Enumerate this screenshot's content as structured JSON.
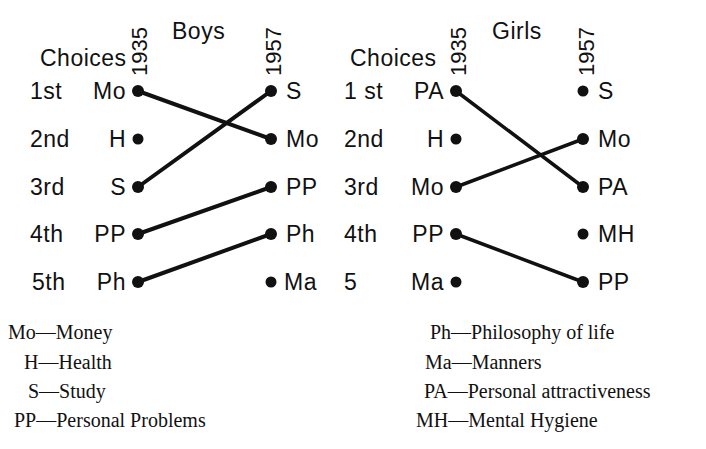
{
  "boys": {
    "title": "Boys",
    "choices_header": "Choices",
    "year_left": "1935",
    "year_right": "1957",
    "ranks": [
      "1st",
      "2nd",
      "3rd",
      "4th",
      "5th"
    ],
    "left_items": [
      "Mo",
      "H",
      "S",
      "PP",
      "Ph"
    ],
    "right_items": [
      "S",
      "Mo",
      "PP",
      "Ph",
      "Ma"
    ],
    "connections": [
      [
        0,
        1
      ],
      [
        2,
        0
      ],
      [
        3,
        2
      ],
      [
        4,
        3
      ]
    ]
  },
  "girls": {
    "title": "Girls",
    "choices_header": "Choices",
    "year_left": "1935",
    "year_right": "1957",
    "ranks": [
      "1 st",
      "2nd",
      "3rd",
      "4th",
      "5"
    ],
    "left_items": [
      "PA",
      "H",
      "Mo",
      "PP",
      "Ma"
    ],
    "right_items": [
      "S",
      "Mo",
      "PA",
      "MH",
      "PP"
    ],
    "connections": [
      [
        0,
        2
      ],
      [
        2,
        1
      ],
      [
        3,
        4
      ]
    ]
  },
  "legend": {
    "left": [
      "Mo—Money",
      "H—Health",
      "S—Study",
      "PP—Personal Problems"
    ],
    "right": [
      "Ph—Philosophy of life",
      "Ma—Manners",
      "PA—Personal attractiveness",
      "MH—Mental Hygiene"
    ]
  }
}
